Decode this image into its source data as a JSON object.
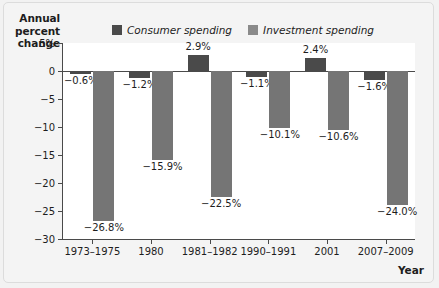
{
  "chart_data": {
    "type": "bar",
    "title": "",
    "subtitle": "",
    "xlabel": "Year",
    "ylabel": "Annual percent change",
    "ylabel_lines": [
      "Annual",
      "percent",
      "change"
    ],
    "categories": [
      "1973–1975",
      "1980",
      "1981–1982",
      "1990–1991",
      "2001",
      "2007–2009"
    ],
    "series": [
      {
        "name": "Consumer spending",
        "color": "#4a4a4a",
        "values": [
          -0.6,
          -1.2,
          2.9,
          -1.1,
          2.4,
          -1.6
        ],
        "labels": [
          "−0.6%",
          "−1.2%",
          "2.9%",
          "−1.1%",
          "2.4%",
          "−1.6%"
        ]
      },
      {
        "name": "Investment spending",
        "color": "#757575",
        "values": [
          -26.8,
          -15.9,
          -22.5,
          -10.1,
          -10.6,
          -24.0
        ],
        "labels": [
          "−26.8%",
          "−15.9%",
          "−22.5%",
          "−10.1%",
          "−10.6%",
          "−24.0%"
        ]
      }
    ],
    "ylim": [
      -30,
      5
    ],
    "yticks": [
      5,
      0,
      -5,
      -10,
      -15,
      -20,
      -25,
      -30
    ],
    "ytick_labels": [
      "5%",
      "0",
      "−5",
      "−10",
      "−15",
      "−20",
      "−25",
      "−30"
    ],
    "grid": false,
    "legend_position": "top-center",
    "zero_line": true
  },
  "legend": {
    "items": [
      {
        "label": "Consumer spending",
        "color": "#4a4a4a"
      },
      {
        "label": "Investment spending",
        "color": "#8a8a8a"
      }
    ]
  },
  "axes": {
    "y_title_line1": "Annual",
    "y_title_line2": "percent",
    "y_title_line3": "change",
    "x_title": "Year"
  }
}
